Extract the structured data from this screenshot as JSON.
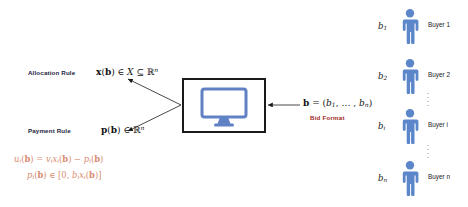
{
  "diagram": {
    "mechanism_box": {
      "icon": "desktop-monitor-icon",
      "icon_color": "#6081c4"
    },
    "left_labels": [
      {
        "caption": "Allocation Rule",
        "formula_plain": "x(b) ∈ X ⊆ ℝⁿ",
        "formula_html": "<b>x</b>(<b>b</b>) ∈ <i>X</i> ⊆ ℝ<span class=\"sup\">n</span>"
      },
      {
        "caption": "Payment Rule",
        "formula_plain": "p(b) ∈ ℝⁿ",
        "formula_html": "<b>p</b>(<b>b</b>) ∈ ℝ<span class=\"sup\">n</span>"
      }
    ],
    "bid_format": {
      "formula_plain": "b = (b₁, … , bₙ)",
      "formula_html": "<b>b</b> = (<i>b</i><span class=\"sub\">1</span>, … , <i>b</i><span class=\"sub\">n</span>)",
      "caption": "Bid Format",
      "caption_color": "#9e2a1e"
    },
    "utility_equations": [
      {
        "plain": "uᵢ(b) = vᵢxᵢ(b) − pᵢ(b)",
        "html": "<i>u</i><span class=\"sub\">i</span>(<b>b</b>) = <i>v</i><span class=\"sub\">i</span><i>x</i><span class=\"sub\">i</span>(<b>b</b>) − <i>p</i><span class=\"sub\">i</span>(<b>b</b>)"
      },
      {
        "plain": "pᵢ(b) ∈ [0, bᵢxᵢ(b)]",
        "html": "<i>p</i><span class=\"sub\">i</span>(<b>b</b>) ∈ [0, <i>b</i><span class=\"sub\">i</span><i>x</i><span class=\"sub\">i</span>(<b>b</b>)]"
      }
    ],
    "utility_color": "#d98c72",
    "buyers": [
      {
        "bid_html": "<i>b</i><span class=\"sub\">1</span>",
        "bid_plain": "b₁",
        "name": "Buyer 1"
      },
      {
        "bid_html": "<i>b</i><span class=\"sub\">2</span>",
        "bid_plain": "b₂",
        "name": "Buyer 2"
      },
      {
        "bid_html": "<i>b</i><span class=\"sub\">i</span>",
        "bid_plain": "bᵢ",
        "name": "Buyer i"
      },
      {
        "bid_html": "<i>b</i><span class=\"sub\">n</span>",
        "bid_plain": "bₙ",
        "name": "Buyer n"
      }
    ],
    "buyer_icon_name": "person-icon",
    "buyer_icon_color": "#5b86c9",
    "ellipsis_glyph": "⋮"
  }
}
